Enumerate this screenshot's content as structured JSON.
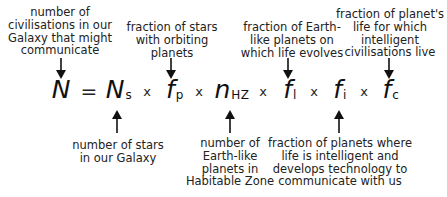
{
  "equation": {
    "lhs": {
      "symbol": "N",
      "sub": ""
    },
    "equals": "=",
    "times": "x",
    "terms": [
      {
        "id": "ns",
        "symbol": "N",
        "sub": "s"
      },
      {
        "id": "fp",
        "symbol": "f",
        "sub": "p"
      },
      {
        "id": "nhz",
        "symbol": "n",
        "sub": "HZ"
      },
      {
        "id": "fl",
        "symbol": "f",
        "sub": "l"
      },
      {
        "id": "fi",
        "symbol": "f",
        "sub": "i"
      },
      {
        "id": "fc",
        "symbol": "f",
        "sub": "c"
      }
    ]
  },
  "labels": {
    "n": [
      "number of",
      "civilisations in our",
      "Galaxy that might",
      "communicate"
    ],
    "fp": [
      "fraction of stars",
      "with orbiting",
      "planets"
    ],
    "fl": [
      "fraction of Earth-",
      "like planets on",
      "which life evolves"
    ],
    "fc": [
      "fraction of planet's",
      "life for which",
      "intelligent",
      "civilisations live"
    ],
    "ns": [
      "number of stars",
      "in our Galaxy"
    ],
    "nhz": [
      "number of",
      "Earth-like",
      "planets in",
      "Habitable Zone"
    ],
    "fi": [
      "fraction of planets where",
      "life is intelligent and",
      "develops technology to",
      "communicate with us"
    ]
  },
  "colors": {
    "text": "#222222",
    "arrow": "#111111",
    "background": "#ffffff"
  }
}
